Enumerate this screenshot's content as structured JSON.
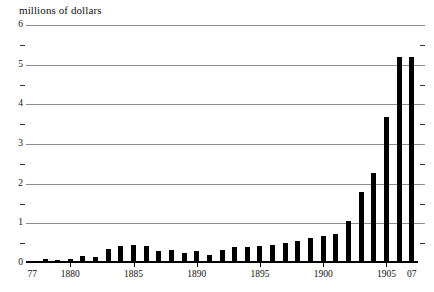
{
  "chart_data": {
    "type": "bar",
    "title": "millions of dollars",
    "xlabel": "",
    "ylabel": "millions of dollars",
    "ylim": [
      0,
      6
    ],
    "y_major_ticks": [
      0,
      1,
      2,
      3,
      4,
      5,
      6
    ],
    "y_minor_ticks": [
      0.5,
      1.5,
      2.5,
      3.5,
      4.5,
      5.5
    ],
    "grid": "horizontal",
    "legend": "none",
    "bar_color": "#000000",
    "gridline_color": "#8f8f8f",
    "axis_color": "#000000",
    "x_tick_labels": [
      {
        "label": "77",
        "year": 1877
      },
      {
        "label": "1880",
        "year": 1880
      },
      {
        "label": "1885",
        "year": 1885
      },
      {
        "label": "1890",
        "year": 1890
      },
      {
        "label": "1895",
        "year": 1895
      },
      {
        "label": "1900",
        "year": 1900
      },
      {
        "label": "1905",
        "year": 1905
      },
      {
        "label": "07",
        "year": 1907
      }
    ],
    "categories": [
      1877,
      1878,
      1879,
      1880,
      1881,
      1882,
      1883,
      1884,
      1885,
      1886,
      1887,
      1888,
      1889,
      1890,
      1891,
      1892,
      1893,
      1894,
      1895,
      1896,
      1897,
      1898,
      1899,
      1900,
      1901,
      1902,
      1903,
      1904,
      1905,
      1906,
      1907
    ],
    "values": [
      0.06,
      0.09,
      0.07,
      0.1,
      0.19,
      0.16,
      0.35,
      0.42,
      0.45,
      0.43,
      0.3,
      0.33,
      0.26,
      0.3,
      0.2,
      0.34,
      0.4,
      0.41,
      0.42,
      0.45,
      0.5,
      0.55,
      0.62,
      0.67,
      0.74,
      1.07,
      1.78,
      2.27,
      3.67,
      5.2,
      5.2
    ]
  }
}
